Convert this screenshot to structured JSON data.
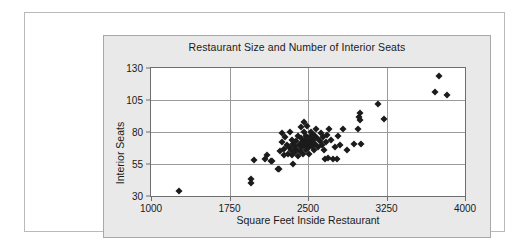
{
  "figure": {
    "background_color": "#ffffff",
    "panel_color": "#e9e9e9",
    "plot_color": "#ffffff",
    "marker_color": "#1b1b1b",
    "grid_color": "#9a9a9a",
    "axis_color": "#6e6e6e"
  },
  "chart_data": {
    "type": "scatter",
    "title": "Restaurant Size and Number of Interior Seats",
    "xlabel": "Square Feet Inside Restaurant",
    "ylabel": "Interior Seats",
    "xlim": [
      1000,
      4000
    ],
    "ylim": [
      30,
      130
    ],
    "xticks": [
      1000,
      1750,
      2500,
      3250,
      4000
    ],
    "yticks": [
      30,
      55,
      80,
      105,
      130
    ],
    "xtick_labels": [
      "1000",
      "1750",
      "2500",
      "3250",
      "4000"
    ],
    "ytick_labels": [
      "30",
      "55",
      "80",
      "105",
      "130"
    ],
    "grid": true,
    "legend": false,
    "marker": "diamond",
    "points": [
      [
        1265,
        34
      ],
      [
        1955,
        43
      ],
      [
        1960,
        40
      ],
      [
        1985,
        58
      ],
      [
        2090,
        59
      ],
      [
        2110,
        62
      ],
      [
        2150,
        57
      ],
      [
        2160,
        57
      ],
      [
        2210,
        51
      ],
      [
        2225,
        51
      ],
      [
        2235,
        65
      ],
      [
        2250,
        79
      ],
      [
        2255,
        72
      ],
      [
        2270,
        67
      ],
      [
        2275,
        62
      ],
      [
        2280,
        76
      ],
      [
        2300,
        70
      ],
      [
        2305,
        63
      ],
      [
        2315,
        68
      ],
      [
        2330,
        80
      ],
      [
        2335,
        66
      ],
      [
        2345,
        74
      ],
      [
        2350,
        62
      ],
      [
        2355,
        55
      ],
      [
        2360,
        71
      ],
      [
        2370,
        69
      ],
      [
        2375,
        64
      ],
      [
        2385,
        73
      ],
      [
        2390,
        67
      ],
      [
        2400,
        61
      ],
      [
        2405,
        77
      ],
      [
        2415,
        70
      ],
      [
        2420,
        65
      ],
      [
        2430,
        84
      ],
      [
        2435,
        75
      ],
      [
        2440,
        68
      ],
      [
        2445,
        72
      ],
      [
        2455,
        63
      ],
      [
        2460,
        88
      ],
      [
        2465,
        80
      ],
      [
        2470,
        74
      ],
      [
        2475,
        70
      ],
      [
        2480,
        66
      ],
      [
        2485,
        77
      ],
      [
        2490,
        71
      ],
      [
        2495,
        85
      ],
      [
        2500,
        73
      ],
      [
        2505,
        68
      ],
      [
        2510,
        63
      ],
      [
        2515,
        76
      ],
      [
        2520,
        72
      ],
      [
        2530,
        80
      ],
      [
        2540,
        69
      ],
      [
        2545,
        74
      ],
      [
        2555,
        66
      ],
      [
        2560,
        78
      ],
      [
        2570,
        71
      ],
      [
        2580,
        82
      ],
      [
        2590,
        75
      ],
      [
        2600,
        68
      ],
      [
        2610,
        73
      ],
      [
        2620,
        79
      ],
      [
        2630,
        70
      ],
      [
        2640,
        76
      ],
      [
        2650,
        66
      ],
      [
        2660,
        59
      ],
      [
        2670,
        72
      ],
      [
        2680,
        78
      ],
      [
        2690,
        60
      ],
      [
        2700,
        82
      ],
      [
        2720,
        74
      ],
      [
        2740,
        59
      ],
      [
        2760,
        68
      ],
      [
        2775,
        59
      ],
      [
        2790,
        77
      ],
      [
        2810,
        70
      ],
      [
        2830,
        82
      ],
      [
        2870,
        66
      ],
      [
        2940,
        71
      ],
      [
        2980,
        82
      ],
      [
        2990,
        92
      ],
      [
        2995,
        95
      ],
      [
        3000,
        89
      ],
      [
        3010,
        71
      ],
      [
        3170,
        102
      ],
      [
        3230,
        90
      ],
      [
        3710,
        111
      ],
      [
        3750,
        124
      ],
      [
        3830,
        109
      ]
    ]
  }
}
